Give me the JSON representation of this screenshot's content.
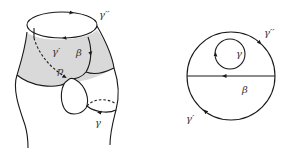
{
  "left_figure": {
    "description": "Surface with shaded annulus, curves on a pair of pants",
    "labels": {
      "gamma_double_prime": "γ′′",
      "gamma_prime": "γ′",
      "beta": "β",
      "p": "p",
      "gamma": "γ"
    }
  },
  "right_figure": {
    "description": "Disk with boundary arcs and inner circle",
    "labels": {
      "gamma_double_prime": "γ′′",
      "gamma": "γ",
      "beta": "β",
      "gamma_prime": "γ′"
    }
  },
  "colors": {
    "stroke": "#1a1a1a",
    "shade": "#d9d9d9",
    "background": "#ffffff",
    "label": "#333333"
  }
}
